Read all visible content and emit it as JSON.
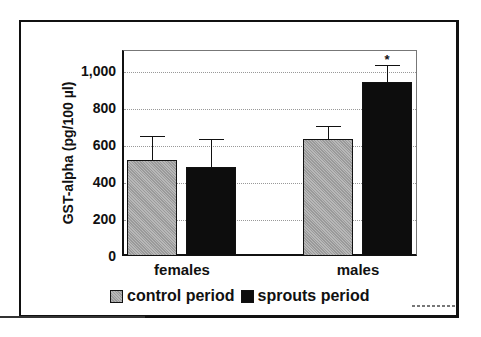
{
  "chart_data": {
    "type": "bar",
    "title": "",
    "xlabel": "",
    "ylabel": "GST-alpha (pg/100 µl)",
    "ylim": [
      0,
      1100
    ],
    "yticks": [
      0,
      200,
      400,
      600,
      800,
      1000
    ],
    "ytick_labels": [
      "0",
      "200",
      "400",
      "600",
      "800",
      "1,000"
    ],
    "grid": "horizontal dotted",
    "categories": [
      "females",
      "males"
    ],
    "series": [
      {
        "name": "control period",
        "values": [
          520,
          635
        ],
        "error_upper": [
          650,
          705
        ],
        "color": "#a8a8a8",
        "pattern": "gray stipple"
      },
      {
        "name": "sprouts period",
        "values": [
          480,
          940
        ],
        "error_upper": [
          630,
          1030
        ],
        "color": "#0d0d0d"
      }
    ],
    "annotations": [
      {
        "category": "males",
        "series": "sprouts period",
        "text": "*"
      }
    ],
    "legend_position": "bottom"
  },
  "axis": {
    "ylabel": "GST-alpha (pg/100 µl)",
    "yticks": [
      "0",
      "200",
      "400",
      "600",
      "800",
      "1,000"
    ]
  },
  "categories": [
    "females",
    "males"
  ],
  "legend": {
    "control": "control period",
    "sprouts": "sprouts period"
  },
  "annotation_star": "*"
}
